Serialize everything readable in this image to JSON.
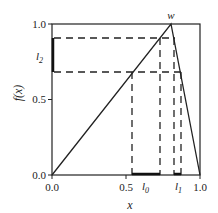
{
  "figure": {
    "ylabel": "f(x)",
    "xlabel": "x",
    "peak_label": "w",
    "interval_labels": {
      "l0": "l",
      "l0_sub": "0",
      "l1": "l",
      "l1_sub": "1",
      "l2": "l",
      "l2_sub": "2"
    },
    "y_ticks": [
      "0.0",
      "0.5",
      "1.0"
    ],
    "x_ticks": [
      "0.0",
      "0.5",
      "1.0"
    ],
    "colors": {
      "line": "#222222",
      "background": "#ffffff"
    }
  }
}
